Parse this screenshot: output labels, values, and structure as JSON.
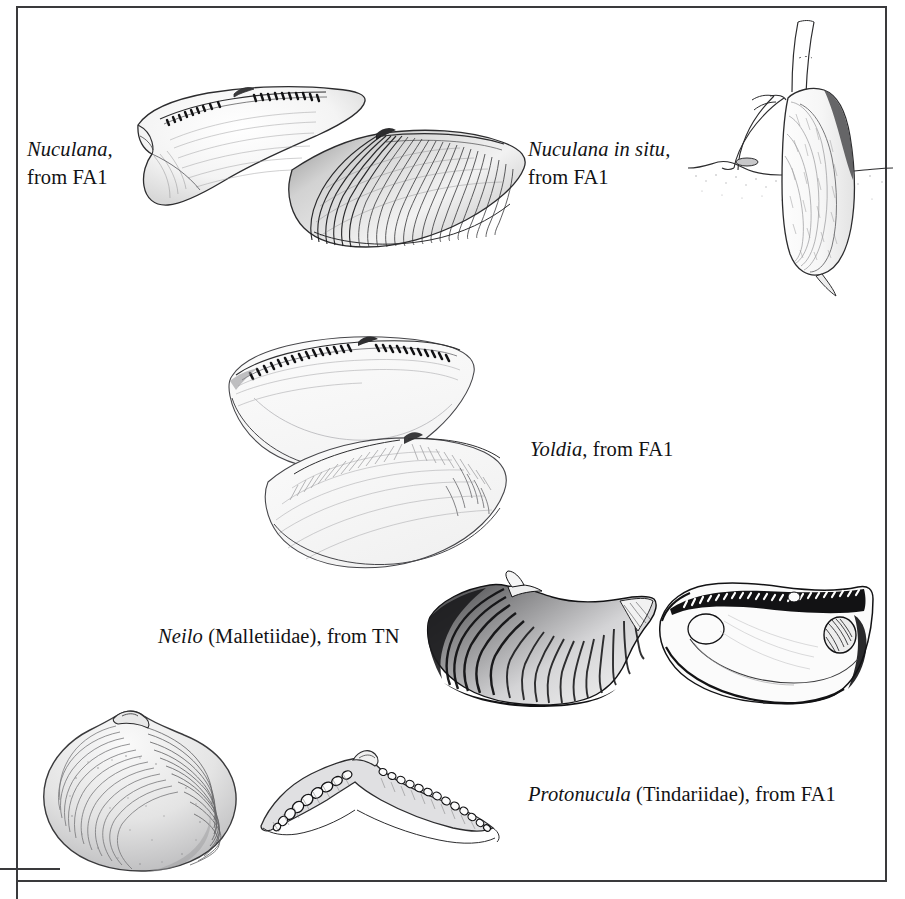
{
  "figure": {
    "kind": "scientific-illustration-plate",
    "background_color": "#ffffff",
    "ink_color": "#121214",
    "frame_color": "#3a3a3c"
  },
  "captions": {
    "nuculana": {
      "genus": "Nuculana,",
      "line2": "from FA1"
    },
    "nuculana_in_situ": {
      "genus": "Nuculana in situ,",
      "line2": "from FA1"
    },
    "yoldia": {
      "genus": "Yoldia",
      "rest": ", from FA1"
    },
    "neilo": {
      "genus": "Neilo",
      "rest": " (Malletiidae), from TN"
    },
    "protonucula": {
      "genus": "Protonucula",
      "rest": " (Tindariidae), from FA1"
    }
  },
  "illustrations": {
    "nuculana_pair": {
      "label": "Nuculana valves, interior and exterior views"
    },
    "nuculana_in_situ": {
      "label": "Nuculana burrowing in life position with siphons above sediment"
    },
    "yoldia_pair": {
      "label": "Yoldia valves, interior hinge view and exterior view"
    },
    "neilo_exterior": {
      "label": "Neilo shell exterior with concentric ribbing"
    },
    "neilo_interior": {
      "label": "Neilo shell interior with taxodont hinge and muscle scars"
    },
    "protonucula_valve": {
      "label": "Protonucula valve exterior with concentric growth lines"
    },
    "protonucula_hinge": {
      "label": "Protonucula chevron hinge with taxodont teeth"
    }
  }
}
